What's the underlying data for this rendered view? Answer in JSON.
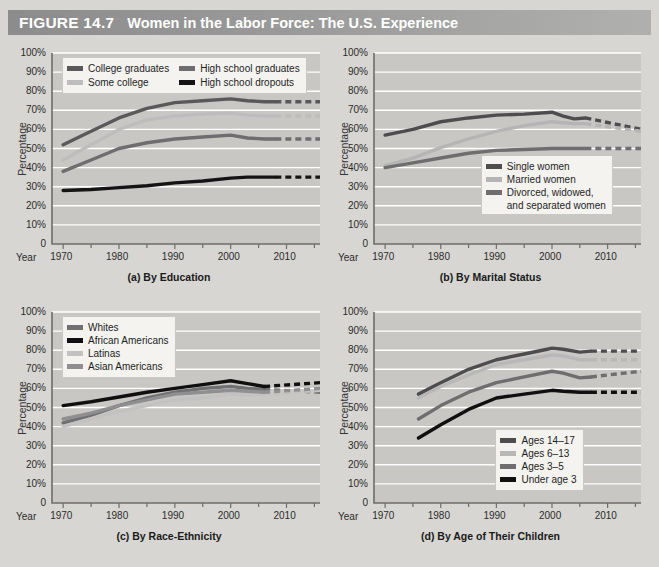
{
  "header": {
    "figure_number": "FIGURE 14.7",
    "title": "Women in the Labor Force: The U.S. Experience",
    "bar_color": "#9a9a9a"
  },
  "common": {
    "ylabel": "Percentage",
    "year_label": "Year",
    "yticks": [
      "100%",
      "90%",
      "80%",
      "70%",
      "60%",
      "50%",
      "40%",
      "30%",
      "20%",
      "10%",
      "0"
    ],
    "xticks": [
      "1970",
      "1980",
      "1990",
      "2000",
      "2010"
    ],
    "plot_bg": "#c8c7c3",
    "gridline_color": "#ffffff"
  },
  "chart_data": [
    {
      "id": "a",
      "type": "line",
      "title": "(a) By Education",
      "xlabel": "Year",
      "ylabel": "Percentage",
      "ylim": [
        0,
        100
      ],
      "xlim": [
        1968,
        2016
      ],
      "grid": true,
      "legend_position": "top-left",
      "xticks": [
        1970,
        1980,
        1990,
        2000,
        2010
      ],
      "yticks": [
        0,
        10,
        20,
        30,
        40,
        50,
        60,
        70,
        80,
        90,
        100
      ],
      "series": [
        {
          "name": "College graduates",
          "color": "#59595b",
          "x": [
            1970,
            1975,
            1980,
            1985,
            1990,
            1995,
            2000,
            2003,
            2006,
            2008
          ],
          "values": [
            52,
            59,
            66,
            71,
            74,
            75,
            76,
            75,
            74.5,
            74.5
          ],
          "projection_x": [
            2008,
            2016
          ],
          "projection_values": [
            74.5,
            74.5
          ]
        },
        {
          "name": "High school graduates",
          "color": "#6e6e70",
          "x": [
            1970,
            1975,
            1980,
            1985,
            1990,
            1995,
            2000,
            2003,
            2006,
            2008
          ],
          "values": [
            38,
            44,
            50,
            53,
            55,
            56,
            57,
            55.5,
            55,
            55
          ],
          "projection_x": [
            2008,
            2016
          ],
          "projection_values": [
            55,
            55
          ]
        },
        {
          "name": "Some college",
          "color": "#bdbdbd",
          "x": [
            1970,
            1975,
            1980,
            1985,
            1990,
            1995,
            2000,
            2003,
            2006,
            2008
          ],
          "values": [
            44,
            52,
            60,
            65,
            67,
            68,
            68.5,
            67.5,
            67,
            67
          ],
          "projection_x": [
            2008,
            2016
          ],
          "projection_values": [
            67,
            67
          ]
        },
        {
          "name": "High school dropouts",
          "color": "#141414",
          "x": [
            1970,
            1975,
            1980,
            1985,
            1990,
            1995,
            2000,
            2003,
            2006,
            2008
          ],
          "values": [
            28,
            28.5,
            29.5,
            30.5,
            32,
            33,
            34.5,
            35,
            35,
            35
          ],
          "projection_x": [
            2008,
            2016
          ],
          "projection_values": [
            35,
            35
          ]
        }
      ]
    },
    {
      "id": "b",
      "type": "line",
      "title": "(b) By Marital Status",
      "xlabel": "Year",
      "ylabel": "Percentage",
      "ylim": [
        0,
        100
      ],
      "xlim": [
        1968,
        2016
      ],
      "grid": true,
      "legend_position": "bottom-right",
      "xticks": [
        1970,
        1980,
        1990,
        2000,
        2010
      ],
      "yticks": [
        0,
        10,
        20,
        30,
        40,
        50,
        60,
        70,
        80,
        90,
        100
      ],
      "series": [
        {
          "name": "Single women",
          "color": "#4d4d4f",
          "x": [
            1970,
            1975,
            1980,
            1985,
            1990,
            1995,
            2000,
            2002,
            2004,
            2006
          ],
          "values": [
            57,
            60,
            64,
            66,
            67.5,
            68,
            69,
            67,
            65.5,
            66
          ],
          "projection_x": [
            2006,
            2016
          ],
          "projection_values": [
            66,
            60
          ]
        },
        {
          "name": "Married women",
          "color": "#b5b5b5",
          "x": [
            1970,
            1975,
            1980,
            1985,
            1990,
            1995,
            2000,
            2002,
            2004,
            2006
          ],
          "values": [
            41,
            45,
            50.5,
            55,
            59,
            62,
            64,
            63.5,
            63,
            63
          ],
          "projection_x": [
            2006,
            2016
          ],
          "projection_values": [
            63,
            59
          ]
        },
        {
          "name": "Divorced, widowed, and separated women",
          "color": "#6e6e70",
          "x": [
            1970,
            1975,
            1980,
            1985,
            1990,
            1995,
            2000,
            2002,
            2004,
            2006
          ],
          "values": [
            40,
            42.5,
            45,
            47.5,
            49,
            49.5,
            50,
            50,
            50,
            50
          ],
          "projection_x": [
            2006,
            2016
          ],
          "projection_values": [
            50,
            50
          ]
        }
      ]
    },
    {
      "id": "c",
      "type": "line",
      "title": "(c) By Race-Ethnicity",
      "xlabel": "Year",
      "ylabel": "Percentage",
      "ylim": [
        0,
        100
      ],
      "xlim": [
        1968,
        2016
      ],
      "grid": true,
      "legend_position": "top-left",
      "xticks": [
        1970,
        1980,
        1990,
        2000,
        2010
      ],
      "yticks": [
        0,
        10,
        20,
        30,
        40,
        50,
        60,
        70,
        80,
        90,
        100
      ],
      "series": [
        {
          "name": "Whites",
          "color": "#707072",
          "x": [
            1970,
            1975,
            1980,
            1985,
            1990,
            1995,
            2000,
            2003,
            2006
          ],
          "values": [
            42,
            46,
            51,
            55,
            58,
            60,
            61,
            60,
            59.5
          ],
          "projection_x": [
            2006,
            2016
          ],
          "projection_values": [
            59.5,
            58
          ]
        },
        {
          "name": "African Americans",
          "color": "#0f0f0f",
          "x": [
            1970,
            1975,
            1980,
            1985,
            1990,
            1995,
            2000,
            2003,
            2006
          ],
          "values": [
            51,
            53,
            55.5,
            58,
            60,
            62,
            64,
            62.5,
            61
          ],
          "projection_x": [
            2006,
            2016
          ],
          "projection_values": [
            61,
            63
          ]
        },
        {
          "name": "Latinas",
          "color": "#c2c2c2",
          "x": [
            1970,
            1975,
            1980,
            1985,
            1990,
            1995,
            2000,
            2003,
            2006
          ],
          "values": [
            40,
            44,
            48,
            51,
            54,
            55,
            57,
            56.5,
            57
          ],
          "projection_x": [
            2006,
            2016
          ],
          "projection_values": [
            57,
            59
          ]
        },
        {
          "name": "Asian Americans",
          "color": "#8f8f91",
          "x": [
            1970,
            1975,
            1980,
            1985,
            1990,
            1995,
            2000,
            2003,
            2006
          ],
          "values": [
            44,
            47,
            51,
            54,
            57,
            58,
            59,
            58.5,
            58
          ],
          "projection_x": [
            2006,
            2016
          ],
          "projection_values": [
            58,
            60
          ]
        }
      ]
    },
    {
      "id": "d",
      "type": "line",
      "title": "(d) By Age of Their Children",
      "xlabel": "Year",
      "ylabel": "Percentage",
      "ylim": [
        0,
        100
      ],
      "xlim": [
        1968,
        2016
      ],
      "grid": true,
      "legend_position": "bottom-right",
      "xticks": [
        1970,
        1980,
        1990,
        2000,
        2010
      ],
      "yticks": [
        0,
        10,
        20,
        30,
        40,
        50,
        60,
        70,
        80,
        90,
        100
      ],
      "series": [
        {
          "name": "Ages 14–17",
          "color": "#4d4d4f",
          "x": [
            1976,
            1980,
            1985,
            1990,
            1995,
            2000,
            2002,
            2005,
            2007
          ],
          "values": [
            57,
            63,
            70,
            75,
            78,
            81,
            80.5,
            79,
            79.5
          ],
          "projection_x": [
            2007,
            2016
          ],
          "projection_values": [
            79.5,
            79.5
          ]
        },
        {
          "name": "Ages 6–13",
          "color": "#b8b8b8",
          "x": [
            1976,
            1980,
            1985,
            1990,
            1995,
            2000,
            2002,
            2005,
            2007
          ],
          "values": [
            55,
            61,
            67,
            72.5,
            75,
            77.5,
            77,
            75,
            75
          ],
          "projection_x": [
            2007,
            2016
          ],
          "projection_values": [
            75,
            75
          ]
        },
        {
          "name": "Ages 3–5",
          "color": "#6e6e70",
          "x": [
            1976,
            1980,
            1985,
            1990,
            1995,
            2000,
            2002,
            2005,
            2007
          ],
          "values": [
            44,
            51,
            58,
            63,
            66,
            69,
            68,
            65.5,
            66
          ],
          "projection_x": [
            2007,
            2016
          ],
          "projection_values": [
            66,
            69
          ]
        },
        {
          "name": "Under age 3",
          "color": "#101010",
          "x": [
            1976,
            1980,
            1985,
            1990,
            1995,
            2000,
            2002,
            2005,
            2007
          ],
          "values": [
            34,
            41,
            49,
            55,
            57,
            59,
            58.5,
            58,
            58
          ],
          "projection_x": [
            2007,
            2016
          ],
          "projection_values": [
            58,
            58
          ]
        }
      ]
    }
  ]
}
